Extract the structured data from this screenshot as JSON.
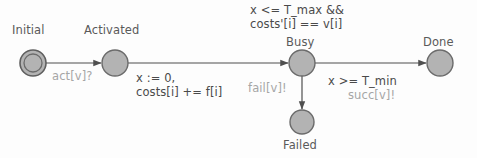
{
  "diagram": {
    "type": "state-machine",
    "colors": {
      "background": "#fdfdfd",
      "node_fill": "#b3b3b3",
      "node_stroke": "#6b6b6b",
      "edge_stroke": "#4f4f4f",
      "label_dark": "#4a4a4a",
      "label_light": "#a6a6a6"
    },
    "states": [
      {
        "id": "initial",
        "label": "Initial",
        "shape": "double-circle",
        "cx": 33,
        "cy": 63,
        "r": 13
      },
      {
        "id": "activated",
        "label": "Activated",
        "shape": "circle",
        "cx": 115,
        "cy": 63,
        "r": 13
      },
      {
        "id": "busy",
        "label": "Busy",
        "shape": "circle",
        "cx": 302,
        "cy": 63,
        "r": 13
      },
      {
        "id": "done",
        "label": "Done",
        "shape": "circle",
        "cx": 440,
        "cy": 63,
        "r": 13
      },
      {
        "id": "failed",
        "label": "Failed",
        "shape": "circle",
        "cx": 302,
        "cy": 122,
        "r": 12
      }
    ],
    "transitions": [
      {
        "id": "initial-to-activated",
        "from": "initial",
        "to": "activated",
        "sync": "act[v]?",
        "guard": "",
        "assign": ""
      },
      {
        "id": "activated-to-busy",
        "from": "activated",
        "to": "busy",
        "sync": "",
        "guard": "x <= T_max &&\ncosts'[i] == v[i]",
        "guard_line1": "x <= T_max &&",
        "guard_line2": "costs'[i] == v[i]",
        "assign_line1": "x := 0,",
        "assign_line2": "costs[i] += f[i]"
      },
      {
        "id": "busy-to-done",
        "from": "busy",
        "to": "done",
        "guard": "x >= T_min",
        "sync": "succ[v]!"
      },
      {
        "id": "busy-to-failed",
        "from": "busy",
        "to": "failed",
        "sync": "fail[v]!",
        "guard": ""
      }
    ]
  }
}
